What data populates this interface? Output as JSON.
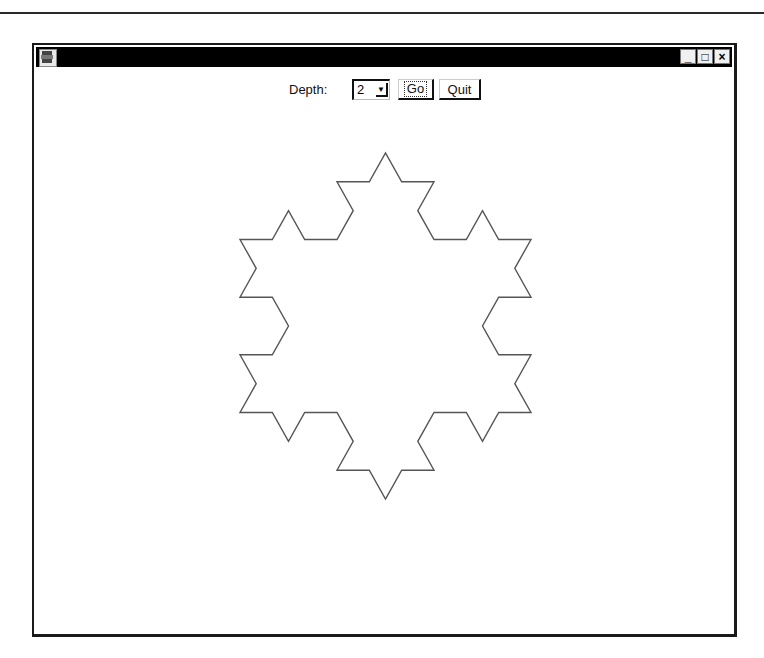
{
  "window": {
    "title": "",
    "app_icon": "python-tk-icon",
    "buttons": {
      "minimize": "_",
      "maximize": "□",
      "close": "×"
    }
  },
  "controls": {
    "depth_label": "Depth:",
    "depth_value": "2",
    "go_label": "Go",
    "quit_label": "Quit"
  },
  "drawing": {
    "shape": "koch-snowflake",
    "depth": 2,
    "stroke_color": "#555555",
    "bbox": {
      "x_min": 240,
      "x_max": 531,
      "y_min": 153,
      "y_max": 499
    },
    "top_vertex": [
      385,
      153
    ],
    "bottom_vertex": [
      390,
      499
    ]
  },
  "colors": {
    "titlebar": "#000000",
    "background": "#ffffff",
    "border": "#1a1a1a"
  }
}
